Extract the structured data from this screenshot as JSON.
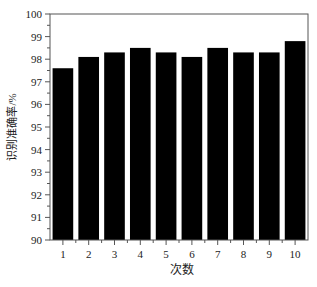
{
  "chart_data": {
    "type": "bar",
    "title": "",
    "xlabel": "次数",
    "ylabel": "识别准确率/%",
    "categories": [
      "1",
      "2",
      "3",
      "4",
      "5",
      "6",
      "7",
      "8",
      "9",
      "10"
    ],
    "values": [
      97.6,
      98.1,
      98.3,
      98.5,
      98.3,
      98.1,
      98.5,
      98.3,
      98.3,
      98.8
    ],
    "ylim": [
      90,
      100
    ],
    "yticks": [
      90,
      91,
      92,
      93,
      94,
      95,
      96,
      97,
      98,
      99,
      100
    ],
    "grid": false,
    "legend": null,
    "bar_color": "#000000"
  }
}
